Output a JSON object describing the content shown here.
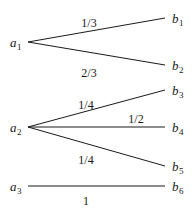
{
  "figure": {
    "background_color": "#ffffff",
    "stroke_color": "#1a1a1a"
  },
  "source_nodes": [
    {
      "id": "a1",
      "base": "a",
      "sub": "1",
      "x": 10,
      "y": 42
    },
    {
      "id": "a2",
      "base": "a",
      "sub": "2",
      "x": 10,
      "y": 127
    },
    {
      "id": "a3",
      "base": "a",
      "sub": "3",
      "x": 10,
      "y": 186
    }
  ],
  "target_nodes": [
    {
      "id": "b1",
      "base": "b",
      "sub": "1",
      "x": 172,
      "y": 18
    },
    {
      "id": "b2",
      "base": "b",
      "sub": "2",
      "x": 172,
      "y": 65
    },
    {
      "id": "b3",
      "base": "b",
      "sub": "3",
      "x": 172,
      "y": 90
    },
    {
      "id": "b4",
      "base": "b",
      "sub": "4",
      "x": 172,
      "y": 127
    },
    {
      "id": "b5",
      "base": "b",
      "sub": "5",
      "x": 172,
      "y": 166
    },
    {
      "id": "b6",
      "base": "b",
      "sub": "6",
      "x": 172,
      "y": 186
    }
  ],
  "edges": [
    {
      "id": "a1-b1",
      "from": "a1",
      "to": "b1",
      "weight": "1/3",
      "x1": 28,
      "y1": 42,
      "x2": 165,
      "y2": 18,
      "label_x": 89,
      "label_y": 23
    },
    {
      "id": "a1-b2",
      "from": "a1",
      "to": "b2",
      "weight": "2/3",
      "x1": 28,
      "y1": 42,
      "x2": 165,
      "y2": 65,
      "label_x": 89,
      "label_y": 73
    },
    {
      "id": "a2-b3",
      "from": "a2",
      "to": "b3",
      "weight": "1/4",
      "x1": 28,
      "y1": 127,
      "x2": 165,
      "y2": 90,
      "label_x": 86,
      "label_y": 105
    },
    {
      "id": "a2-b4",
      "from": "a2",
      "to": "b4",
      "weight": "1/2",
      "x1": 28,
      "y1": 127,
      "x2": 165,
      "y2": 127,
      "label_x": 136,
      "label_y": 119
    },
    {
      "id": "a2-b5",
      "from": "a2",
      "to": "b5",
      "weight": "1/4",
      "x1": 28,
      "y1": 127,
      "x2": 165,
      "y2": 166,
      "label_x": 86,
      "label_y": 160
    },
    {
      "id": "a3-b6",
      "from": "a3",
      "to": "b6",
      "weight": "1",
      "x1": 28,
      "y1": 186,
      "x2": 165,
      "y2": 186,
      "label_x": 86,
      "label_y": 201
    }
  ],
  "edge_labels": {
    "a1_b1": "1/3",
    "a1_b2": "2/3",
    "a2_b3": "1/4",
    "a2_b4": "1/2",
    "a2_b5": "1/4",
    "a3_b6": "1"
  },
  "node_labels": {
    "a1_base": "a",
    "a1_sub": "1",
    "a2_base": "a",
    "a2_sub": "2",
    "a3_base": "a",
    "a3_sub": "3",
    "b1_base": "b",
    "b1_sub": "1",
    "b2_base": "b",
    "b2_sub": "2",
    "b3_base": "b",
    "b3_sub": "3",
    "b4_base": "b",
    "b4_sub": "4",
    "b5_base": "b",
    "b5_sub": "5",
    "b6_base": "b",
    "b6_sub": "6"
  }
}
